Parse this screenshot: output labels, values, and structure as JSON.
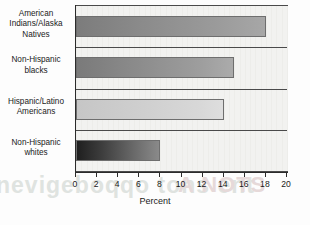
{
  "chart_data": {
    "type": "bar",
    "orientation": "horizontal",
    "title": "",
    "xlabel": "Percent",
    "ylabel": "",
    "xlim": [
      0,
      20
    ],
    "xticks": [
      0,
      2,
      4,
      6,
      8,
      10,
      12,
      14,
      16,
      18,
      20
    ],
    "xtick_labels": [
      "0",
      "2",
      "4",
      "6",
      "8",
      "10",
      "12",
      "14",
      "16",
      "18",
      "20"
    ],
    "grid": true,
    "legend": false,
    "categories": [
      "American Indians/Alaska Natives",
      "Non-Hispanic blacks",
      "Hispanic/Latino Americans",
      "Non-Hispanic whites"
    ],
    "category_lines": [
      [
        "American",
        "Indians/Alaska",
        "Natives"
      ],
      [
        "Non-Hispanic",
        "blacks"
      ],
      [
        "Hispanic/Latino",
        "Americans"
      ],
      [
        "Non-Hispanic",
        "whites"
      ]
    ],
    "values": [
      18,
      15,
      14,
      8
    ],
    "bar_fills": [
      "linear-gradient(to right,#7c7c7c 0%,#8b8b8b 35%,#9b9b9b 75%,#a7a7a7 100%)",
      "linear-gradient(to right,#7a7a7a 0%,#8c8c8c 40%,#9e9e9e 80%,#ababab 100%)",
      "linear-gradient(to right,#c6c6c6 0%,#cfcfcf 45%,#d8d8d8 85%,#dedede 100%)",
      "linear-gradient(to right,#1f1f1f 0%,#3d3d3d 30%,#6a6a6a 70%,#8a8a8a 100%)"
    ],
    "plot_background": "#f2f2f0",
    "frame_color": "#4a4a4a",
    "axis_color": "#2b2b2b",
    "text_color": "#1a1a1a"
  },
  "watermark": {
    "line_a": "a keyhole",
    "line_b": "nevigeboqqo tons ent",
    "line_c": "A NOTS"
  }
}
